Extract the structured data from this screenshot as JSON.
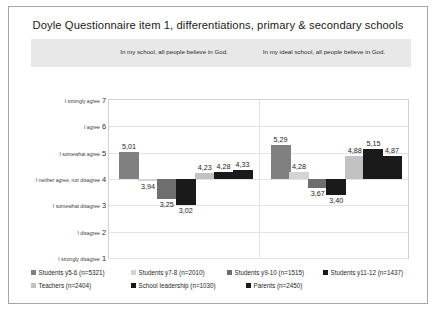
{
  "chart_data": {
    "type": "bar",
    "title": "Doyle Questionnaire item 1, differentiations, primary & secondary schools",
    "xlabel": "",
    "ylabel": "",
    "ylim": [
      1,
      7
    ],
    "grid": true,
    "legend_position": "bottom",
    "baseline": 4,
    "y_ticks": [
      {
        "value": 7,
        "label": "I strongly agree"
      },
      {
        "value": 6,
        "label": "I agree"
      },
      {
        "value": 5,
        "label": "I somewhat agree"
      },
      {
        "value": 4,
        "label": "I neither agree, nor disagree"
      },
      {
        "value": 3,
        "label": "I somewhat disagree"
      },
      {
        "value": 2,
        "label": "I disagree"
      },
      {
        "value": 1,
        "label": "I strongly disagree"
      }
    ],
    "categories": [
      "In my school, all people believe in God.",
      "In my ideal school, all people believe in God."
    ],
    "series": [
      {
        "name": "Students y5-6 (n=5321)",
        "color": "#808080",
        "values": [
          5.01,
          5.29
        ],
        "labels": [
          "5,01",
          "5,29"
        ]
      },
      {
        "name": "Students y7-8 (n=2010)",
        "color": "#d4d4d4",
        "values": [
          3.94,
          4.28
        ],
        "labels": [
          "3,94",
          "4,28"
        ]
      },
      {
        "name": "Students y9-10 (n=1515)",
        "color": "#6e6e6e",
        "values": [
          3.25,
          3.67
        ],
        "labels": [
          "3,25",
          "3,67"
        ]
      },
      {
        "name": "Students y11-12 (n=1437)",
        "color": "#1a1a1a",
        "values": [
          3.02,
          3.4
        ],
        "labels": [
          "3,02",
          "3,40"
        ]
      },
      {
        "name": "Teachers (n=2404)",
        "color": "#c2c2c2",
        "values": [
          4.23,
          4.88
        ],
        "labels": [
          "4,23",
          "4,88"
        ]
      },
      {
        "name": "School leadership (n=1030)",
        "color": "#1a1a1a",
        "values": [
          4.28,
          5.15
        ],
        "labels": [
          "4,28",
          "5,15"
        ]
      },
      {
        "name": "Parents (n=2450)",
        "color": "#1a1a1a",
        "values": [
          4.33,
          4.87
        ],
        "labels": [
          "4,33",
          "4,87"
        ]
      }
    ]
  }
}
